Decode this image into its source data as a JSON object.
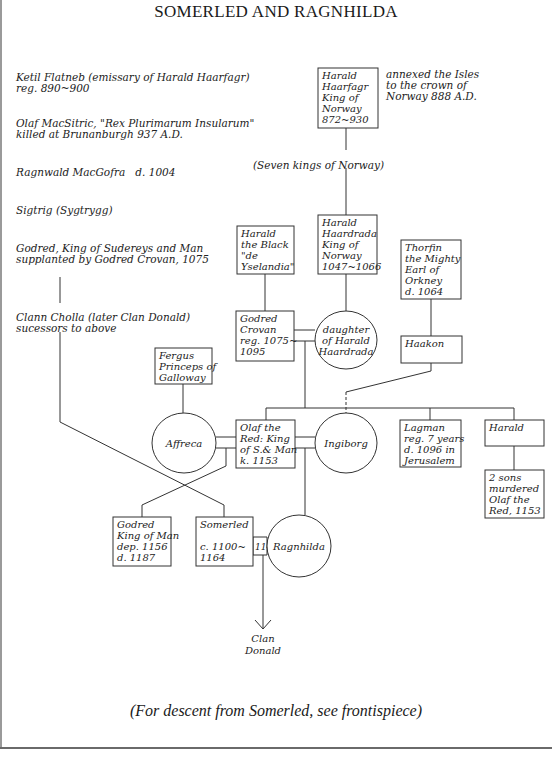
{
  "title": "SOMERLED AND RAGNHILDA",
  "footer": "(For descent from Somerled, see frontispiece)",
  "left_notes": [
    {
      "lines": "Ketil Flatneb (emissary of Harald Haarfagr)\nreg. 890~900",
      "x": 16,
      "y": 72
    },
    {
      "lines": "Olaf MacSitric, \"Rex Plurimarum Insularum\"\nkilled at Brunanburgh 937 A.D.",
      "x": 16,
      "y": 118
    },
    {
      "lines": "Ragnwald MacGofra   d. 1004",
      "x": 16,
      "y": 167
    },
    {
      "lines": "Sigtrig (Sygtrygg)",
      "x": 16,
      "y": 205
    },
    {
      "lines": "Godred, King of Sudereys and Man\nsupplanted by Godred Crovan, 1075",
      "x": 16,
      "y": 243
    },
    {
      "lines": "Clann Cholla (later Clan Donald)\nsucessors to above",
      "x": 16,
      "y": 312
    }
  ],
  "annotations": [
    {
      "id": "annexed-note",
      "lines": "annexed the Isles\nto the crown of\nNorway 888 A.D.",
      "x": 386,
      "y": 69
    },
    {
      "id": "seven-kings",
      "lines": "(Seven kings of Norway)",
      "x": 253,
      "y": 160
    }
  ],
  "boxes": [
    {
      "id": "harald-haarfagr",
      "x": 318,
      "y": 68,
      "w": 60,
      "h": 60,
      "lines": [
        "Harald",
        "Haarfagr",
        "King of",
        "Norway",
        "872~930"
      ]
    },
    {
      "id": "harald-the-black",
      "x": 237,
      "y": 226,
      "w": 57,
      "h": 48,
      "lines": [
        "Harald",
        "the Black",
        "\"de",
        "Yselandia\""
      ]
    },
    {
      "id": "harald-haardrada",
      "x": 318,
      "y": 215,
      "w": 59,
      "h": 59,
      "lines": [
        "Harald",
        "Haardrada",
        "King of",
        "Norway",
        "1047~1066"
      ]
    },
    {
      "id": "thorfin-the-mighty",
      "x": 401,
      "y": 240,
      "w": 60,
      "h": 59,
      "lines": [
        "Thorfin",
        "the Mighty",
        "Earl of",
        "Orkney",
        "d. 1064"
      ]
    },
    {
      "id": "godred-crovan",
      "x": 236,
      "y": 311,
      "w": 58,
      "h": 50,
      "lines": [
        "Godred",
        "Crovan",
        "reg. 1075~",
        "1095"
      ]
    },
    {
      "id": "haakon",
      "x": 401,
      "y": 336,
      "w": 61,
      "h": 27,
      "lines": [
        "Haakon"
      ]
    },
    {
      "id": "fergus",
      "x": 155,
      "y": 348,
      "w": 57,
      "h": 36,
      "lines": [
        "Fergus",
        "Princeps of",
        "Galloway"
      ]
    },
    {
      "id": "olaf-the-red",
      "x": 236,
      "y": 420,
      "w": 59,
      "h": 48,
      "lines": [
        "Olaf the",
        "Red: King",
        "of S.& Man",
        "k. 1153"
      ]
    },
    {
      "id": "lagman",
      "x": 400,
      "y": 420,
      "w": 61,
      "h": 47,
      "lines": [
        "Lagman",
        "reg. 7 years",
        "d. 1096 in",
        "Jerusalem"
      ]
    },
    {
      "id": "harald",
      "x": 485,
      "y": 420,
      "w": 59,
      "h": 26,
      "lines": [
        "Harald"
      ]
    },
    {
      "id": "two-sons",
      "x": 485,
      "y": 470,
      "w": 59,
      "h": 48,
      "lines": [
        "2 sons",
        "murdered",
        "Olaf the",
        "Red, 1153"
      ]
    },
    {
      "id": "godred-king-of-man",
      "x": 113,
      "y": 517,
      "w": 58,
      "h": 49,
      "lines": [
        "Godred",
        "King of Man",
        "dep. 1156",
        "d. 1187"
      ]
    },
    {
      "id": "somerled",
      "x": 196,
      "y": 517,
      "w": 57,
      "h": 49,
      "lines": [
        "Somerled",
        "",
        "c. 1100~",
        "1164"
      ]
    }
  ],
  "ovals": [
    {
      "id": "daughter-of-harald-haardrada",
      "cx": 346,
      "cy": 340,
      "rx": 31,
      "ry": 29,
      "lines": [
        "daughter",
        "of Harald",
        "Haardrada"
      ]
    },
    {
      "id": "affreca",
      "cx": 184,
      "cy": 443,
      "rx": 32,
      "ry": 30,
      "label": "Affreca"
    },
    {
      "id": "ingiborg",
      "cx": 346,
      "cy": 443,
      "rx": 31,
      "ry": 30,
      "label": "Ingiborg"
    },
    {
      "id": "ragnhilda",
      "cx": 299,
      "cy": 546,
      "rx": 32,
      "ry": 31,
      "label": "Ragnhilda"
    }
  ],
  "marriage_label": "1140",
  "clan_donald": [
    "Clan",
    "Donald"
  ]
}
